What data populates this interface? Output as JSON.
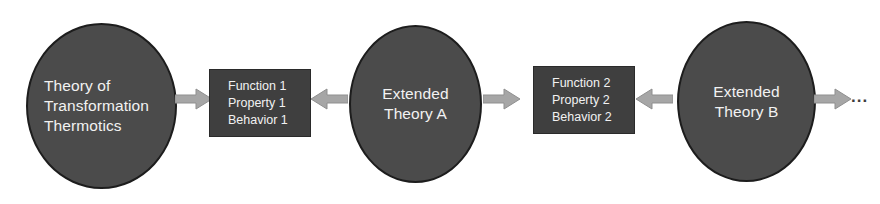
{
  "diagram": {
    "type": "flow-diagram",
    "colors": {
      "background": "#ffffff",
      "circle_fill": "#4b4b4b",
      "circle_border": "#1d1d1d",
      "box_fill": "#3f3f3f",
      "box_border": "#2a2a2a",
      "arrow_fill": "#a6a6a6",
      "arrow_border": "#8a8a8a",
      "text": "#f2f2f2",
      "ellipsis": "#3c3c3c"
    },
    "nodes": {
      "circle1": {
        "shape": "ellipse",
        "lines": [
          "Theory of",
          "Transformation",
          "Thermotics"
        ]
      },
      "box1": {
        "shape": "rectangle",
        "lines": [
          "Function 1",
          "Property 1",
          "Behavior 1"
        ]
      },
      "circle2": {
        "shape": "ellipse",
        "lines": [
          "Extended",
          "Theory A"
        ]
      },
      "box2": {
        "shape": "rectangle",
        "lines": [
          "Function 2",
          "Property 2",
          "Behavior 2"
        ]
      },
      "circle3": {
        "shape": "ellipse",
        "lines": [
          "Extended",
          "Theory B"
        ]
      },
      "continuation": {
        "label": "..."
      }
    },
    "arrows": [
      {
        "id": "arrow-1",
        "direction": "right",
        "from": "circle1",
        "to": "box1"
      },
      {
        "id": "arrow-2",
        "direction": "left",
        "from": "circle2",
        "to": "box1"
      },
      {
        "id": "arrow-3",
        "direction": "right",
        "from": "circle2",
        "to": "box2"
      },
      {
        "id": "arrow-4",
        "direction": "left",
        "from": "circle3",
        "to": "box2"
      },
      {
        "id": "arrow-5",
        "direction": "right",
        "from": "circle3",
        "to": "continuation"
      }
    ]
  }
}
